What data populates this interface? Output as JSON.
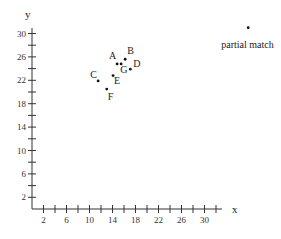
{
  "chart_data": {
    "type": "scatter",
    "title": "",
    "xlabel": "x",
    "ylabel": "y",
    "xlim": [
      0,
      33
    ],
    "ylim": [
      0,
      31
    ],
    "grid": false,
    "legend": null,
    "x_ticks": [
      2,
      6,
      10,
      14,
      18,
      22,
      26,
      30
    ],
    "y_ticks": [
      2,
      6,
      10,
      14,
      18,
      22,
      26,
      30
    ],
    "minor_tick_step": 2,
    "points": [
      {
        "label": "A",
        "x": 14.8,
        "y": 24.8,
        "label_dx": -8,
        "label_dy": -5
      },
      {
        "label": "B",
        "x": 16.2,
        "y": 25.6,
        "label_dx": 2,
        "label_dy": -5
      },
      {
        "label": "G",
        "x": 15.5,
        "y": 24.8,
        "label_dx": -1,
        "label_dy": 9
      },
      {
        "label": "D",
        "x": 17.1,
        "y": 23.9,
        "label_dx": 3,
        "label_dy": -2
      },
      {
        "label": "E",
        "x": 14.1,
        "y": 22.8,
        "label_dx": 1,
        "label_dy": 8
      },
      {
        "label": "C",
        "x": 11.5,
        "y": 21.9,
        "label_dx": -8,
        "label_dy": -3
      },
      {
        "label": "F",
        "x": 13.0,
        "y": 20.5,
        "label_dx": 1,
        "label_dy": 11
      },
      {
        "label": "partial match",
        "x": 37.6,
        "y": 31.0,
        "label_dx": -27,
        "label_dy": 20
      }
    ]
  },
  "geometry": {
    "origin_px": [
      32,
      209
    ],
    "px_per_unit_x": 5.75,
    "px_per_unit_y": 5.85,
    "x_axis_end_px": 222,
    "y_axis_top_px": 28
  }
}
